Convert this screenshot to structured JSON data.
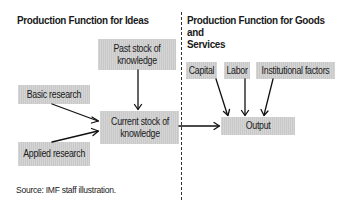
{
  "left_panel": {
    "title": "Production Function for Ideas",
    "nodes": {
      "past_stock": "Past stock of knowledge",
      "basic_research": "Basic research",
      "current_stock": "Current stock of knowledge",
      "applied_research": "Applied research"
    }
  },
  "right_panel": {
    "title_line1": "Production Function for Goods and",
    "title_line2": "Services",
    "nodes": {
      "capital": "Capital",
      "labor": "Labor",
      "institutional_factors": "Institutional factors",
      "output": "Output"
    }
  },
  "edges": [
    {
      "from": "past_stock",
      "to": "current_stock"
    },
    {
      "from": "basic_research",
      "to": "current_stock"
    },
    {
      "from": "applied_research",
      "to": "current_stock"
    },
    {
      "from": "current_stock",
      "to": "output"
    },
    {
      "from": "capital",
      "to": "output"
    },
    {
      "from": "labor",
      "to": "output"
    },
    {
      "from": "institutional_factors",
      "to": "output"
    }
  ],
  "source_note": "Source: IMF staff illustration.",
  "colors": {
    "box_fill": "#c9c9c9",
    "line": "#111111"
  }
}
